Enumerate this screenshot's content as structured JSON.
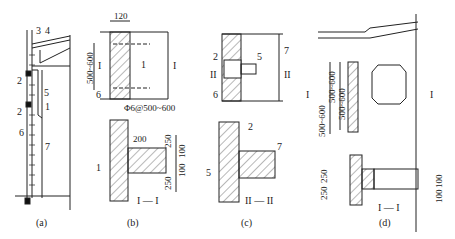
{
  "figure": {
    "panels": [
      {
        "id": "a",
        "caption": "(a)",
        "labels": [
          "3",
          "4",
          "2",
          "5",
          "2",
          "1",
          "6",
          "7"
        ]
      },
      {
        "id": "b",
        "caption": "(b)",
        "top_dim": "120",
        "side_dim": "500~600",
        "section_mark": "I",
        "rebar": "Φ6@500~600",
        "labels": [
          "1",
          "6"
        ],
        "section_title": "I — I",
        "dims": [
          "200",
          "250",
          "100",
          "100",
          "250"
        ],
        "section_labels": [
          "1"
        ]
      },
      {
        "id": "c",
        "caption": "(c)",
        "section_mark": "II",
        "labels": [
          "2",
          "5",
          "6",
          "7"
        ],
        "section_title": "II — II",
        "section_labels": [
          "2",
          "7",
          "5"
        ]
      },
      {
        "id": "d",
        "caption": "(d)",
        "section_mark": "I",
        "dims_top": [
          "500~600",
          "500~600",
          "500~600"
        ],
        "section_title": "I — I",
        "dims_bottom": [
          "250",
          "250",
          "100",
          "100"
        ]
      }
    ]
  }
}
